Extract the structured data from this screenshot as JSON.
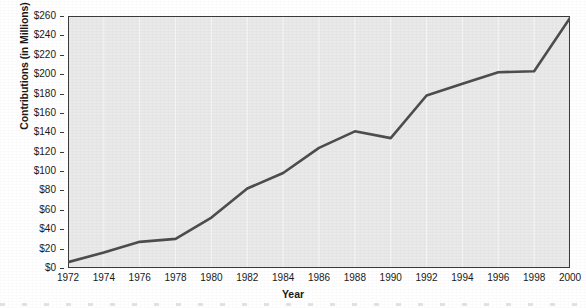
{
  "chart_data": {
    "type": "line",
    "title": "",
    "xlabel": "Year",
    "ylabel": "Contributions (in Millions)",
    "x": [
      1972,
      1974,
      1976,
      1978,
      1980,
      1982,
      1984,
      1986,
      1988,
      1990,
      1992,
      1994,
      1996,
      1998,
      2000
    ],
    "values": [
      6,
      16,
      27,
      30,
      52,
      82,
      98,
      124,
      141,
      134,
      178,
      190,
      202,
      203,
      258
    ],
    "xtick_labels": [
      "1972",
      "1974",
      "1976",
      "1978",
      "1980",
      "1982",
      "1984",
      "1986",
      "1988",
      "1990",
      "1992",
      "1994",
      "1996",
      "1998",
      "2000"
    ],
    "ytick_values": [
      0,
      20,
      40,
      60,
      80,
      100,
      120,
      140,
      160,
      180,
      200,
      220,
      240,
      260
    ],
    "ytick_labels": [
      "$0",
      "$20",
      "$40",
      "$60",
      "$80",
      "$100",
      "$120",
      "$140",
      "$160",
      "$180",
      "$200",
      "$220",
      "$240",
      "$260"
    ],
    "xlim": [
      1972,
      2000
    ],
    "ylim": [
      0,
      260
    ],
    "grid": "vertical-only",
    "legend": "none",
    "series_name": "Contributions",
    "colors": {
      "line": "#4d4d4d",
      "plot_background": "#e9e9e9",
      "figure_background": "#ffffff",
      "axis": "#3b3b3b",
      "gridline": "#f5f5f5",
      "text": "#1a1a1a"
    },
    "line_width_px": 2.6
  }
}
